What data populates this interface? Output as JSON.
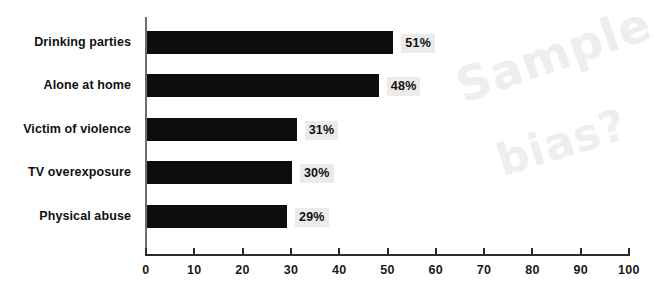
{
  "chart_data": {
    "type": "bar",
    "orientation": "horizontal",
    "title": "",
    "subtitle": "",
    "xlabel": "",
    "ylabel": "",
    "categories": [
      "Drinking parties",
      "Alone at home",
      "Victim of violence",
      "TV overexposure",
      "Physical abuse"
    ],
    "values": [
      51,
      48,
      31,
      30,
      29
    ],
    "value_labels": [
      "51%",
      "48%",
      "31%",
      "30%",
      "29%"
    ],
    "xlim": [
      0,
      100
    ],
    "xticks": [
      0,
      10,
      20,
      30,
      40,
      50,
      60,
      70,
      80,
      90,
      100
    ],
    "xtick_labels": [
      "0",
      "10",
      "20",
      "30",
      "40",
      "50",
      "60",
      "70",
      "80",
      "90",
      "100"
    ],
    "grid": false,
    "legend": null,
    "bar_color": "#0d0d0d",
    "value_label_background": "#ebebeb",
    "axis_color": "#2b2b2b",
    "background": "#ffffff"
  },
  "annotation": {
    "name": "handwritten-note",
    "line1": "Sample",
    "line2": "bias?",
    "color": "#eeeeee"
  }
}
